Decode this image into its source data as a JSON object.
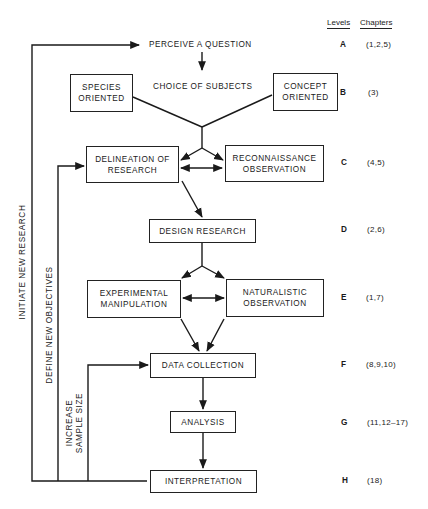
{
  "headers": {
    "levels": "Levels",
    "chapters": "Chapters"
  },
  "nodes": {
    "perceive": "PERCEIVE A QUESTION",
    "choice": "CHOICE OF SUBJECTS",
    "species": "SPECIES\nORIENTED",
    "concept": "CONCEPT\nORIENTED",
    "delineation": "DELINEATION OF\nRESEARCH",
    "reconnaissance": "RECONNAISSANCE\nOBSERVATION",
    "design": "DESIGN RESEARCH",
    "experimental": "EXPERIMENTAL\nMANIPULATION",
    "naturalistic": "NATURALISTIC\nOBSERVATION",
    "data_collection": "DATA COLLECTION",
    "analysis": "ANALYSIS",
    "interpretation": "INTERPRETATION"
  },
  "feedback_loops": {
    "initiate": "INITIATE NEW RESEARCH",
    "define": "DEFINE NEW OBJECTIVES",
    "increase": "INCREASE\nSAMPLE SIZE"
  },
  "levels": [
    {
      "level": "A",
      "chapters": "(1,2,5)"
    },
    {
      "level": "B",
      "chapters": "(3)"
    },
    {
      "level": "C",
      "chapters": "(4,5)"
    },
    {
      "level": "D",
      "chapters": "(2,6)"
    },
    {
      "level": "E",
      "chapters": "(1,7)"
    },
    {
      "level": "F",
      "chapters": "(8,9,10)"
    },
    {
      "level": "G",
      "chapters": "(11,12–17)"
    },
    {
      "level": "H",
      "chapters": "(18)"
    }
  ]
}
